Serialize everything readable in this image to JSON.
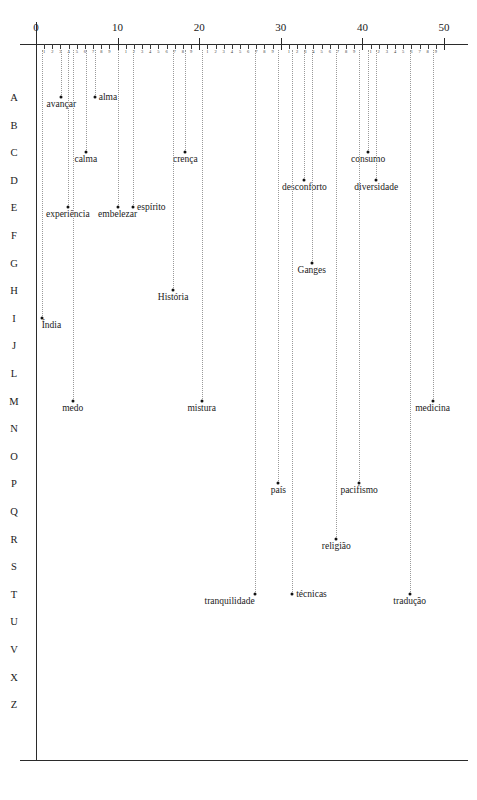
{
  "chart_data": {
    "type": "scatter",
    "title": "",
    "xlabel": "",
    "ylabel": "",
    "xlim": [
      0,
      50
    ],
    "ylim_categories": [
      "A",
      "B",
      "C",
      "D",
      "E",
      "F",
      "G",
      "H",
      "I",
      "J",
      "L",
      "M",
      "N",
      "O",
      "P",
      "Q",
      "R",
      "S",
      "T",
      "U",
      "V",
      "X",
      "Z"
    ],
    "x_major_ticks": [
      0,
      10,
      20,
      30,
      40,
      50
    ],
    "x_major_tick_labels": [
      "0",
      "10",
      "20",
      "30",
      "40",
      "50"
    ],
    "x_minor_tick_labels": [
      "1",
      "2",
      "3",
      "4",
      "5",
      "6",
      "7",
      "8",
      "9"
    ],
    "grid": false,
    "legend": "none",
    "drop_lines": "vertical dotted from axis to point",
    "points": [
      {
        "label": "avançar",
        "x": 3.1,
        "row": "A",
        "label_pos": "bc"
      },
      {
        "label": "alma",
        "x": 7.2,
        "row": "A",
        "label_pos": "lr"
      },
      {
        "label": "calma",
        "x": 6.1,
        "row": "C",
        "label_pos": "bc"
      },
      {
        "label": "crença",
        "x": 18.3,
        "row": "C",
        "label_pos": "bc"
      },
      {
        "label": "consumo",
        "x": 40.7,
        "row": "C",
        "label_pos": "bc"
      },
      {
        "label": "desconforto",
        "x": 32.9,
        "row": "D",
        "label_pos": "bc"
      },
      {
        "label": "diversidade",
        "x": 41.7,
        "row": "D",
        "label_pos": "bc"
      },
      {
        "label": "experiência",
        "x": 3.9,
        "row": "E",
        "label_pos": "bc"
      },
      {
        "label": "embelezar",
        "x": 10.0,
        "row": "E",
        "label_pos": "bc"
      },
      {
        "label": "espírito",
        "x": 11.9,
        "row": "E",
        "label_pos": "lr"
      },
      {
        "label": "Ganges",
        "x": 33.8,
        "row": "G",
        "label_pos": "bc"
      },
      {
        "label": "História",
        "x": 16.8,
        "row": "H",
        "label_pos": "bc"
      },
      {
        "label": "Índia",
        "x": 0.7,
        "row": "I",
        "label_pos": "br"
      },
      {
        "label": "medo",
        "x": 4.5,
        "row": "M",
        "label_pos": "bc"
      },
      {
        "label": "mistura",
        "x": 20.3,
        "row": "M",
        "label_pos": "bc"
      },
      {
        "label": "medicina",
        "x": 48.6,
        "row": "M",
        "label_pos": "bc"
      },
      {
        "label": "país",
        "x": 29.7,
        "row": "P",
        "label_pos": "bc"
      },
      {
        "label": "pacifismo",
        "x": 39.6,
        "row": "P",
        "label_pos": "bc"
      },
      {
        "label": "religião",
        "x": 36.8,
        "row": "R",
        "label_pos": "bc"
      },
      {
        "label": "tranquilidade",
        "x": 26.8,
        "row": "T",
        "label_pos": "bl"
      },
      {
        "label": "técnicas",
        "x": 31.4,
        "row": "T",
        "label_pos": "lr"
      },
      {
        "label": "tradução",
        "x": 45.8,
        "row": "T",
        "label_pos": "bc"
      }
    ]
  },
  "geometry": {
    "x0_px": 36,
    "px_per_unit": 8.16,
    "axis_y_px": 44,
    "row_top_px": 97,
    "row_step_px": 27.6,
    "axis_left_px": 20,
    "axis_right_px": 468,
    "vline_top_px": 22,
    "vline_bottom_px": 760,
    "baseline_y_px": 760,
    "letter_col_x_px": 14
  },
  "colors": {
    "ink": "#1a1a1a",
    "axis": "#2b2b2b",
    "dropline": "#9a9a9a",
    "point": "#111111",
    "background": "#ffffff"
  }
}
